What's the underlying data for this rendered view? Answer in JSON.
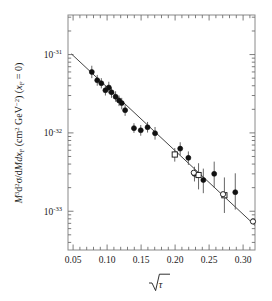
{
  "chart_data": {
    "type": "scatter",
    "title": "",
    "xlabel": "√τ",
    "ylabel": "M³d²σ/dMdx_F  (cm² GeV⁻²) (x_F = 0)",
    "xscale": "linear",
    "yscale": "log",
    "xlim": [
      0.0425,
      0.3175
    ],
    "ylim": [
      3.2e-34,
      3.2e-31
    ],
    "grid": false,
    "legend": null,
    "xticks": [
      0.05,
      0.1,
      0.15,
      0.2,
      0.25,
      0.3
    ],
    "xtick_labels": [
      "0.05",
      "0.10",
      "0.15",
      "0.20",
      "0.25",
      "0.30"
    ],
    "yticks": [
      1e-31,
      1e-32,
      1e-33
    ],
    "ytick_labels": [
      "10⁻³¹",
      "10⁻³²",
      "10⁻³³"
    ],
    "ytick_mantissas": [
      -31,
      -32,
      -33
    ],
    "series": [
      {
        "name": "filled-circles",
        "marker": "filled-circle",
        "color": "#111111",
        "points": [
          {
            "x": 0.0775,
            "y": 6e-32,
            "yerr_lo": 1e-32,
            "yerr_hi": 1.2e-32
          },
          {
            "x": 0.0855,
            "y": 4.7e-32,
            "yerr_lo": 7e-33,
            "yerr_hi": 8e-33
          },
          {
            "x": 0.0915,
            "y": 4.3e-32,
            "yerr_lo": 6e-33,
            "yerr_hi": 7e-33
          },
          {
            "x": 0.0975,
            "y": 3.5e-32,
            "yerr_lo": 5e-33,
            "yerr_hi": 5e-33
          },
          {
            "x": 0.1025,
            "y": 3.8e-32,
            "yerr_lo": 6e-33,
            "yerr_hi": 7e-33
          },
          {
            "x": 0.1065,
            "y": 3.3e-32,
            "yerr_lo": 5e-33,
            "yerr_hi": 5e-33
          },
          {
            "x": 0.1125,
            "y": 2.9e-32,
            "yerr_lo": 4e-33,
            "yerr_hi": 5e-33
          },
          {
            "x": 0.1175,
            "y": 2.6e-32,
            "yerr_lo": 4e-33,
            "yerr_hi": 4e-33
          },
          {
            "x": 0.1215,
            "y": 2.4e-32,
            "yerr_lo": 4e-33,
            "yerr_hi": 4e-33
          },
          {
            "x": 0.1265,
            "y": 1.95e-32,
            "yerr_lo": 3e-33,
            "yerr_hi": 3.5e-33
          },
          {
            "x": 0.1395,
            "y": 1.15e-32,
            "yerr_lo": 1.5e-33,
            "yerr_hi": 1.8e-33
          },
          {
            "x": 0.1495,
            "y": 1.08e-32,
            "yerr_lo": 1.6e-33,
            "yerr_hi": 1.8e-33
          },
          {
            "x": 0.1595,
            "y": 1.18e-32,
            "yerr_lo": 1.7e-33,
            "yerr_hi": 2e-33
          },
          {
            "x": 0.1705,
            "y": 9.9e-33,
            "yerr_lo": 1.7e-33,
            "yerr_hi": 2e-33
          },
          {
            "x": 0.2075,
            "y": 6.3e-33,
            "yerr_lo": 1.1e-33,
            "yerr_hi": 1.3e-33
          },
          {
            "x": 0.2195,
            "y": 4.8e-33,
            "yerr_lo": 9e-34,
            "yerr_hi": 1e-33
          },
          {
            "x": 0.2285,
            "y": 3e-33,
            "yerr_lo": 6e-34,
            "yerr_hi": 7e-34
          },
          {
            "x": 0.2415,
            "y": 2.5e-33,
            "yerr_lo": 8e-34,
            "yerr_hi": 1e-33
          },
          {
            "x": 0.2575,
            "y": 3e-33,
            "yerr_lo": 1e-33,
            "yerr_hi": 1.3e-33
          },
          {
            "x": 0.2885,
            "y": 1.75e-33,
            "yerr_lo": 7e-34,
            "yerr_hi": 1.3e-33
          }
        ]
      },
      {
        "name": "open-squares",
        "marker": "open-square",
        "color": "#111111",
        "points": [
          {
            "x": 0.1995,
            "y": 5.3e-33,
            "yerr_lo": 1e-33,
            "yerr_hi": 1.1e-33
          },
          {
            "x": 0.2345,
            "y": 2.9e-33,
            "yerr_lo": 1e-33,
            "yerr_hi": 1.2e-33
          },
          {
            "x": 0.2725,
            "y": 1.6e-33,
            "yerr_lo": 6.5e-34,
            "yerr_hi": 1.1e-33
          }
        ]
      },
      {
        "name": "open-circles",
        "marker": "open-circle",
        "color": "#111111",
        "points": [
          {
            "x": 0.2275,
            "y": 3.1e-33,
            "yerr_lo": 0.0,
            "yerr_hi": 0.0
          },
          {
            "x": 0.2705,
            "y": 1.65e-33,
            "yerr_lo": 0.0,
            "yerr_hi": 0.0
          },
          {
            "x": 0.3145,
            "y": 7.4e-34,
            "yerr_lo": 0.0,
            "yerr_hi": 0.0
          }
        ]
      }
    ],
    "fit_line": {
      "name": "exponential-fit",
      "color": "#444444",
      "x_start": 0.0475,
      "y_start": 1.02e-31,
      "x_end": 0.3175,
      "y_end": 6.6e-34
    }
  },
  "axis": {
    "y_label_parts": {
      "m": "M",
      "m_exp": "3",
      "d": "d",
      "d_exp": "2",
      "sigma": "σ/d",
      "md": "Md",
      "x": "x",
      "x_sub": "F",
      "units_open": "(cm",
      "units_cm_exp": "2",
      "units_gev": " GeV",
      "units_gev_exp": "−2",
      "units_close": ") (",
      "xf": "x",
      "xf_sub": "F",
      "eq": " = 0)"
    },
    "x_label_symbol": "τ"
  }
}
